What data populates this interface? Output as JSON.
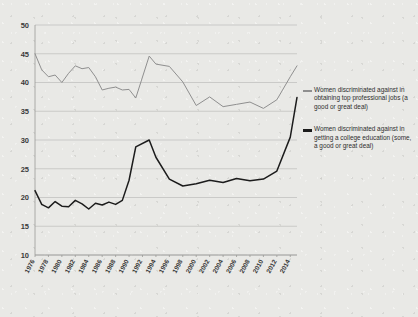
{
  "chart_data": {
    "type": "line",
    "title": "",
    "subtitle": "",
    "xlabel": "",
    "ylabel": "",
    "xlim": [
      1976,
      2015
    ],
    "ylim": [
      10,
      50
    ],
    "yticks": [
      10,
      15,
      20,
      25,
      30,
      35,
      40,
      45,
      50
    ],
    "grid": true,
    "legend_position": "right",
    "x": [
      1976,
      1977,
      1978,
      1979,
      1980,
      1981,
      1982,
      1983,
      1984,
      1985,
      1986,
      1987,
      1988,
      1989,
      1990,
      1991,
      1993,
      1994,
      1996,
      1998,
      2000,
      2002,
      2004,
      2006,
      2008,
      2010,
      2012,
      2014,
      2015
    ],
    "xtick_labels": [
      "1976",
      "1978",
      "1980",
      "1982",
      "1984",
      "1986",
      "1988",
      "1990",
      "1992",
      "1994",
      "1996",
      "1998",
      "2000",
      "2002",
      "2004",
      "2006",
      "2008",
      "2010",
      "2012",
      "2014"
    ],
    "series": [
      {
        "name": "Women discriminated against in obtaining top professional jobs (a good or great deal)",
        "color": "#8f8f8f",
        "values": [
          45.0,
          42.2,
          41.0,
          41.3,
          40.0,
          41.6,
          42.9,
          42.4,
          42.6,
          41.0,
          38.7,
          39.0,
          39.2,
          38.7,
          38.8,
          37.3,
          44.6,
          43.2,
          42.8,
          40.1,
          36.0,
          37.5,
          35.8,
          36.2,
          36.6,
          35.5,
          37.0,
          41.0,
          42.9
        ]
      },
      {
        "name": "Women discriminated against in getting a college education (some, a good or great deal)",
        "color": "#1c1c1c",
        "values": [
          21.2,
          18.8,
          18.2,
          19.3,
          18.5,
          18.4,
          19.5,
          18.9,
          18.0,
          19.0,
          18.7,
          19.2,
          18.8,
          19.5,
          23.0,
          28.8,
          30.0,
          27.0,
          23.2,
          22.0,
          22.4,
          23.0,
          22.6,
          23.3,
          22.9,
          23.2,
          24.6,
          30.5,
          37.4
        ]
      }
    ],
    "legend": [
      {
        "label": "Women discriminated against in obtaining top professional jobs (a good or great deal)",
        "color": "#8f8f8f"
      },
      {
        "label": "Women discriminated against in getting a college education (some, a good or great deal)",
        "color": "#1c1c1c"
      }
    ]
  }
}
